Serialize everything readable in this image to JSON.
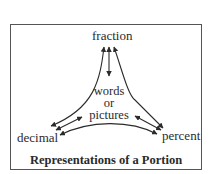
{
  "diagram": {
    "title": "Representations of a Portion",
    "nodes": {
      "top": "fraction",
      "left": "decimal",
      "right": "percent",
      "center": [
        "words",
        "or",
        "pictures"
      ]
    },
    "edges": [
      {
        "from": "fraction",
        "to": "decimal",
        "style": "curved",
        "direction": "bidirectional"
      },
      {
        "from": "fraction",
        "to": "percent",
        "style": "curved",
        "direction": "bidirectional"
      },
      {
        "from": "fraction",
        "to": "words or pictures",
        "style": "straight",
        "direction": "bidirectional"
      },
      {
        "from": "decimal",
        "to": "words or pictures",
        "style": "straight",
        "direction": "bidirectional"
      },
      {
        "from": "words or pictures",
        "to": "percent",
        "style": "straight",
        "direction": "bidirectional"
      },
      {
        "from": "decimal",
        "to": "percent",
        "style": "curved",
        "direction": "bidirectional"
      }
    ],
    "colors": {
      "ink": "#2b2b2b",
      "border": "#555555",
      "background": "#ffffff"
    }
  }
}
